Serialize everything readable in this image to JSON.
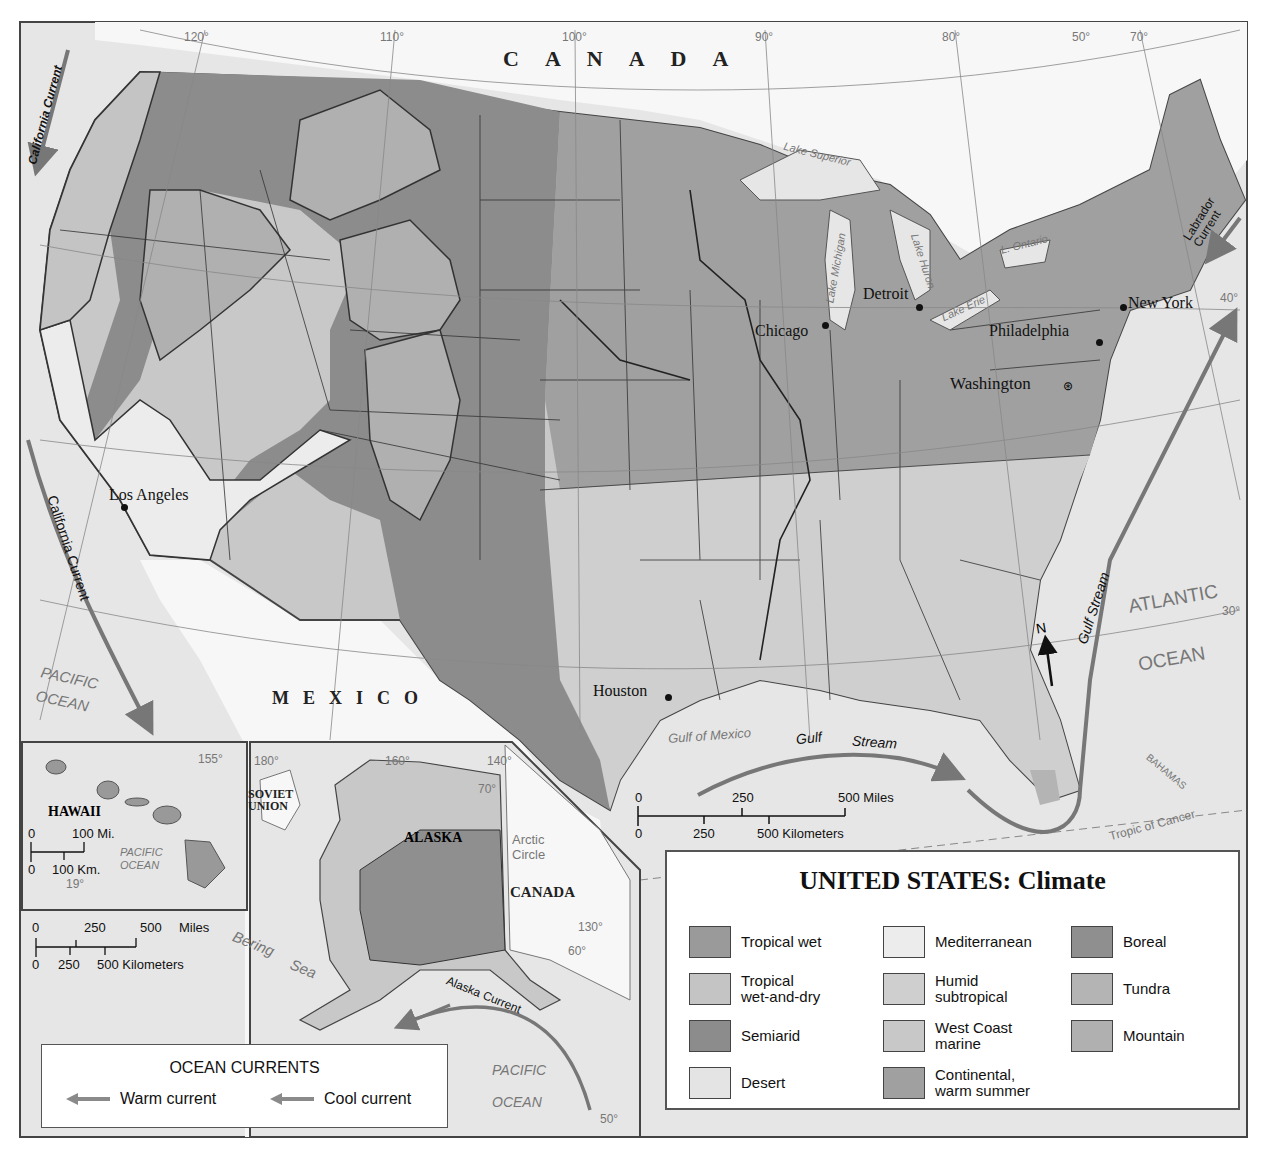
{
  "title": "UNITED STATES: Climate",
  "countries": {
    "canada": "CANADA",
    "mexico": "MEXICO",
    "canada_inset": "CANADA",
    "soviet_union": "SOVIET\nUNION"
  },
  "states": {
    "hawaii": "HAWAII",
    "alaska": "ALASKA"
  },
  "cities": [
    {
      "name": "Los Angeles"
    },
    {
      "name": "Chicago"
    },
    {
      "name": "Detroit"
    },
    {
      "name": "New York"
    },
    {
      "name": "Philadelphia"
    },
    {
      "name": "Washington"
    },
    {
      "name": "Houston"
    }
  ],
  "water_bodies": {
    "pacific_ocean": "PACIFIC\nOCEAN",
    "pacific_ocean_hawaii": "PACIFIC\nOCEAN",
    "pacific_ocean_alaska_1": "PACIFIC",
    "pacific_ocean_alaska_2": "OCEAN",
    "atlantic": "ATLANTIC",
    "ocean": "OCEAN",
    "gulf_of_mexico": "Gulf of Mexico",
    "bering_sea_1": "Bering",
    "bering_sea_2": "Sea",
    "lake_superior": "Lake Superior",
    "lake_michigan": "Lake Michigan",
    "lake_huron": "Lake Huron",
    "lake_erie": "Lake Erie",
    "lake_ontario": "L. Ontario",
    "bahamas": "BAHAMAS",
    "tropic_of_cancer": "Tropic of Cancer",
    "arctic_circle": "Arctic\nCircle"
  },
  "currents": {
    "california_north": "California Current",
    "california_south": "California Current",
    "labrador": "Labrador\nCurrent",
    "gulf_stream_gulf_1": "Gulf",
    "gulf_stream_gulf_2": "Stream",
    "gulf_stream_atlantic": "Gulf Stream",
    "alaska": "Alaska Current"
  },
  "coordinates": {
    "lon_120": "120°",
    "lon_110": "110°",
    "lon_100": "100°",
    "lon_90": "90°",
    "lon_80": "80°",
    "lat_50_top": "50°",
    "lon_70": "70°",
    "lat_40": "40°",
    "lat_30": "30°",
    "hi_155": "155°",
    "hi_19": "19°",
    "ak_180": "180°",
    "ak_160": "160°",
    "ak_140": "140°",
    "ak_70": "70°",
    "ak_130": "130°",
    "ak_60": "60°",
    "ak_50": "50°"
  },
  "compass": {
    "north": "N"
  },
  "scale_main": {
    "miles": [
      "0",
      "250",
      "500 Miles"
    ],
    "km": [
      "0",
      "250",
      "500 Kilometers"
    ]
  },
  "scale_hawaii": {
    "miles": [
      "0",
      "100 Mi."
    ],
    "km": [
      "0",
      "100 Km."
    ]
  },
  "scale_alaska": {
    "miles": [
      "0",
      "250",
      "500",
      "Miles"
    ],
    "km": [
      "0",
      "250",
      "500 Kilometers"
    ]
  },
  "legend": {
    "items": [
      {
        "label": "Tropical wet",
        "color": "#9a9a9a"
      },
      {
        "label": "Tropical\nwet-and-dry",
        "color": "#c4c4c4"
      },
      {
        "label": "Semiarid",
        "color": "#8c8c8c"
      },
      {
        "label": "Desert",
        "color": "#e4e4e4"
      },
      {
        "label": "Mediterranean",
        "color": "#ececec"
      },
      {
        "label": "Humid\nsubtropical",
        "color": "#cfcfcf"
      },
      {
        "label": "West Coast\nmarine",
        "color": "#c8c8c8"
      },
      {
        "label": "Continental,\nwarm summer",
        "color": "#a0a0a0"
      },
      {
        "label": "Boreal",
        "color": "#8f8f8f"
      },
      {
        "label": "Tundra",
        "color": "#b4b4b4"
      },
      {
        "label": "Mountain",
        "color": "#b0b0b0"
      }
    ]
  },
  "ocean_currents_legend": {
    "title": "OCEAN CURRENTS",
    "warm": "Warm current",
    "cool": "Cool current",
    "warm_color": "#8a8a8a",
    "cool_color": "#8a8a8a"
  },
  "colors": {
    "water": "#e6e6e6",
    "foreign_land": "#f7f7f7",
    "border": "#555555"
  }
}
